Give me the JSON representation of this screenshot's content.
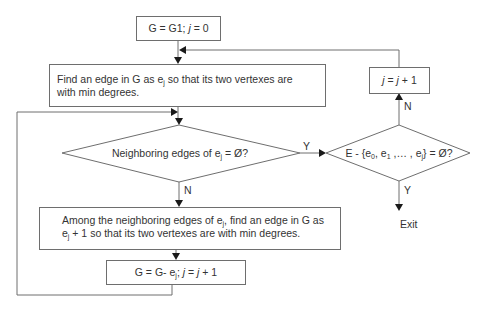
{
  "diagram": {
    "type": "flowchart",
    "nodes": {
      "init": {
        "shape": "rectangle",
        "parts": [
          "G = G1; ",
          "j",
          " = 0"
        ]
      },
      "find_edge": {
        "shape": "rectangle",
        "line1_a": "Find an edge in G as e",
        "line1_sub": "j",
        "line1_b": " so that its two vertexes are",
        "line2": "with min degrees."
      },
      "neighbor_check": {
        "shape": "diamond",
        "text_a": "Neighboring edges of e",
        "text_sub": "j",
        "text_b": " = Ø?"
      },
      "among": {
        "shape": "rectangle",
        "line1_a": "Among the neighboring edges of e",
        "line1_sub": "j",
        "line1_b": ", find an edge in G as",
        "line2_a": "e",
        "line2_sub": "j",
        "line2_b": " + 1 so that its two vertexes are with min degrees."
      },
      "update": {
        "shape": "rectangle",
        "text_a": "G = G- e",
        "text_sub": "j",
        "text_b": "; ",
        "text_j1": "j",
        "text_c": " = ",
        "text_j2": "j",
        "text_d": " + 1"
      },
      "remaining_check": {
        "shape": "diamond",
        "text_a": "E - {e",
        "sub0": "0",
        "text_b": ", e",
        "sub1": "1",
        "text_c": " ,… , e",
        "subj": "j",
        "text_d": "} = Ø?"
      },
      "increment": {
        "shape": "rectangle",
        "j1": "j",
        "mid": " = ",
        "j2": "j",
        "end": " + 1"
      },
      "exit": {
        "shape": "terminal-label",
        "text": "Exit"
      }
    },
    "edge_labels": {
      "neighbor_yes": "Y",
      "neighbor_no": "N",
      "remaining_yes": "Y",
      "remaining_no": "N"
    },
    "edges": [
      {
        "from": "init",
        "to": "find_edge"
      },
      {
        "from": "find_edge",
        "to": "neighbor_check"
      },
      {
        "from": "neighbor_check",
        "to": "remaining_check",
        "label": "Y"
      },
      {
        "from": "neighbor_check",
        "to": "among",
        "label": "N"
      },
      {
        "from": "among",
        "to": "update"
      },
      {
        "from": "update",
        "to": "neighbor_check"
      },
      {
        "from": "remaining_check",
        "to": "increment",
        "label": "N"
      },
      {
        "from": "remaining_check",
        "to": "exit",
        "label": "Y"
      },
      {
        "from": "increment",
        "to": "find_edge"
      }
    ],
    "colors": {
      "line": "#6e6e6e",
      "arrow": "#1a1a1a",
      "text": "#333333",
      "background": "#ffffff"
    }
  }
}
